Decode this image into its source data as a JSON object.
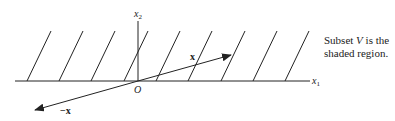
{
  "figure": {
    "axes": {
      "x_axis_label": "x",
      "x_axis_sub": "1",
      "y_axis_label": "x",
      "y_axis_sub": "2",
      "origin_label": "O"
    },
    "vectors": [
      {
        "label": "x",
        "direction": "up-right"
      },
      {
        "label": "−x",
        "direction": "down-left"
      }
    ],
    "caption": {
      "line1_pre": "Subset ",
      "line1_var": "V",
      "line1_post": " is the",
      "line2": "shaded region."
    },
    "hatch_count": 9,
    "colors": {
      "line": "#222222",
      "background": "#ffffff"
    }
  }
}
